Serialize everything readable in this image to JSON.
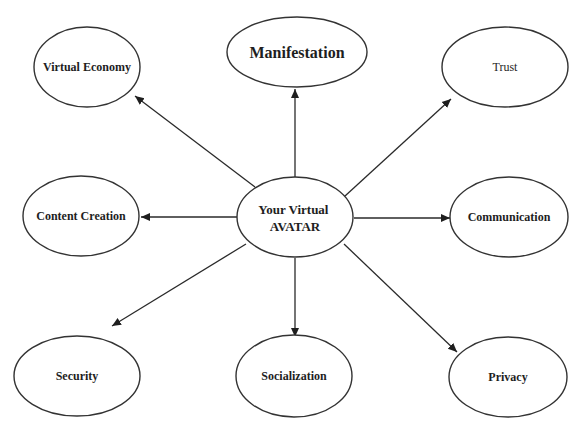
{
  "diagram": {
    "type": "hub-and-spoke",
    "colors": {
      "stroke": "#333333",
      "text": "#1e1e1e",
      "background": "#ffffff"
    },
    "center": {
      "id": "avatar",
      "label_lines": [
        "Your Virtual",
        "AVATAR"
      ],
      "cx": 295,
      "cy": 217,
      "rx": 58,
      "ry": 40,
      "font_size": 13,
      "bold": true
    },
    "nodes": [
      {
        "id": "virtual-economy",
        "label": "Virtual Economy",
        "cx": 87,
        "cy": 67,
        "rx": 53,
        "ry": 40,
        "font_size": 12,
        "bold": true
      },
      {
        "id": "manifestation",
        "label": "Manifestation",
        "cx": 297,
        "cy": 52,
        "rx": 70,
        "ry": 35,
        "font_size": 16,
        "bold": true
      },
      {
        "id": "trust",
        "label": "Trust",
        "cx": 505,
        "cy": 67,
        "rx": 63,
        "ry": 40,
        "font_size": 12,
        "bold": false
      },
      {
        "id": "content-creation",
        "label": "Content Creation",
        "cx": 81,
        "cy": 216,
        "rx": 58,
        "ry": 40,
        "font_size": 12,
        "bold": true
      },
      {
        "id": "communication",
        "label": "Communication",
        "cx": 509,
        "cy": 217,
        "rx": 59,
        "ry": 40,
        "font_size": 12,
        "bold": true
      },
      {
        "id": "security",
        "label": "Security",
        "cx": 77,
        "cy": 376,
        "rx": 63,
        "ry": 40,
        "font_size": 12,
        "bold": true
      },
      {
        "id": "socialization",
        "label": "Socialization",
        "cx": 294,
        "cy": 376,
        "rx": 58,
        "ry": 41,
        "font_size": 12,
        "bold": true
      },
      {
        "id": "privacy",
        "label": "Privacy",
        "cx": 508,
        "cy": 377,
        "rx": 59,
        "ry": 40,
        "font_size": 12,
        "bold": true
      }
    ],
    "edges": [
      {
        "from": "avatar",
        "to": "virtual-economy",
        "x1": 255,
        "y1": 187,
        "x2": 135,
        "y2": 96
      },
      {
        "from": "avatar",
        "to": "manifestation",
        "x1": 295,
        "y1": 177,
        "x2": 295,
        "y2": 89
      },
      {
        "from": "avatar",
        "to": "trust",
        "x1": 345,
        "y1": 196,
        "x2": 451,
        "y2": 99
      },
      {
        "from": "avatar",
        "to": "content-creation",
        "x1": 237,
        "y1": 217,
        "x2": 141,
        "y2": 217
      },
      {
        "from": "avatar",
        "to": "communication",
        "x1": 354,
        "y1": 218,
        "x2": 450,
        "y2": 218
      },
      {
        "from": "avatar",
        "to": "security",
        "x1": 246,
        "y1": 244,
        "x2": 112,
        "y2": 326
      },
      {
        "from": "avatar",
        "to": "socialization",
        "x1": 295,
        "y1": 258,
        "x2": 295,
        "y2": 337
      },
      {
        "from": "avatar",
        "to": "privacy",
        "x1": 344,
        "y1": 244,
        "x2": 457,
        "y2": 352
      }
    ]
  }
}
